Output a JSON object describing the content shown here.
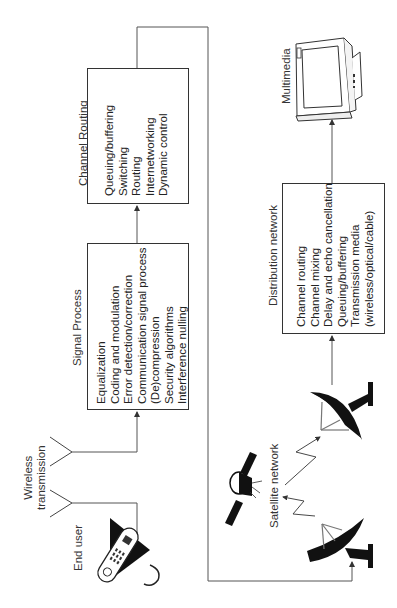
{
  "diagram": {
    "orientation": "rotated-90-ccw",
    "nodes": {
      "channel_routing": {
        "title": "Channel Routing",
        "items": [
          "Queuing/buffering",
          "Switching",
          "Routing",
          "Internetworking",
          "Dynamic control"
        ]
      },
      "signal_process": {
        "title": "Signal Process",
        "items": [
          "Equalization",
          "Coding and modulation",
          "Error detection/correction",
          "Communication signal process",
          "(De)compression",
          "Security algorithms",
          "Interference nulling"
        ]
      },
      "distribution_network": {
        "title": "Distribution network",
        "items": [
          "Channel routing",
          "Channel mixing",
          "Delay and echo cancellation",
          "Queuing/buffering",
          "Transmission media",
          "(wireless/optical/cable)"
        ]
      }
    },
    "labels": {
      "end_user": "End user",
      "wireless_line1": "Wireless",
      "wireless_line2": "transmission",
      "satellite_network": "Satellite network",
      "multimedia": "Multimedia"
    },
    "flow": [
      "End user",
      "Wireless transmission",
      "Signal Process",
      "Channel Routing",
      "Satellite network",
      "Distribution network",
      "Multimedia"
    ]
  }
}
